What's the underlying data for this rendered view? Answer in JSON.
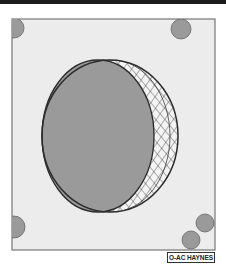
{
  "figure": {
    "credit_label": "O-AC HAYNES",
    "colors": {
      "frame_fill": "#ececec",
      "frame_stroke": "#777777",
      "disc_fill": "#9a9a9a",
      "outline": "#2b2b2b",
      "hatch": "#3a3a3a",
      "crescent_fill": "#f4f4f4",
      "top_rule": "#1c1c1c"
    },
    "elements": [
      {
        "name": "frame",
        "shape": "rectangle"
      },
      {
        "name": "outer-circle",
        "shape": "ellipse",
        "style": "outline"
      },
      {
        "name": "inner-disc",
        "shape": "ellipse",
        "style": "solid-gray"
      },
      {
        "name": "crescent",
        "shape": "crescent",
        "style": "cross-hatched"
      },
      {
        "name": "corner-dots",
        "count": 5,
        "style": "solid-gray"
      }
    ]
  }
}
